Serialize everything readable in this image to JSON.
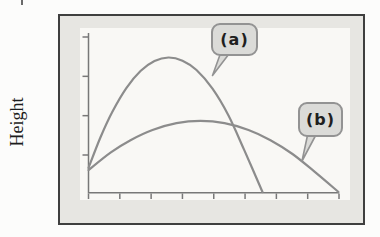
{
  "figure": {
    "ylabel": "Height",
    "xlabel": "",
    "title": "",
    "callouts": [
      {
        "id": "a",
        "label": "(a)",
        "points_to": "tall narrow curve"
      },
      {
        "id": "b",
        "label": "(b)",
        "points_to": "low wide curve"
      }
    ]
  },
  "chart_data": {
    "type": "line",
    "title": "",
    "xlabel": "",
    "ylabel": "Height",
    "xlim": [
      0,
      1
    ],
    "ylim": [
      0,
      1
    ],
    "grid": false,
    "axis_tick_numbers_shown": false,
    "x_tick_count": 9,
    "y_tick_count": 4,
    "legend_position": "callout bubbles attached to curves",
    "series": [
      {
        "name": "(a)",
        "shape": "tall narrow arc; starts partway up left axis, peaks at x~0.32, returns to baseline at x~0.70",
        "points": [
          [
            0,
            0.151
          ],
          [
            0.048,
            0.344
          ],
          [
            0.096,
            0.506
          ],
          [
            0.152,
            0.655
          ],
          [
            0.208,
            0.761
          ],
          [
            0.264,
            0.824
          ],
          [
            0.32,
            0.846
          ],
          [
            0.376,
            0.826
          ],
          [
            0.432,
            0.767
          ],
          [
            0.496,
            0.65
          ],
          [
            0.56,
            0.481
          ],
          [
            0.624,
            0.26
          ],
          [
            0.696,
            0
          ]
        ]
      },
      {
        "name": "(b)",
        "shape": "low wide arc; starts at same left-axis point, peaks at x~0.45 at about half the height of (a), returns to baseline at right end of axis",
        "points": [
          [
            0,
            0.138
          ],
          [
            0.088,
            0.248
          ],
          [
            0.168,
            0.326
          ],
          [
            0.256,
            0.39
          ],
          [
            0.352,
            0.433
          ],
          [
            0.448,
            0.447
          ],
          [
            0.544,
            0.433
          ],
          [
            0.64,
            0.39
          ],
          [
            0.728,
            0.326
          ],
          [
            0.816,
            0.239
          ],
          [
            0.904,
            0.128
          ],
          [
            1,
            0
          ]
        ]
      }
    ]
  },
  "style": {
    "page_bg": "#fcfcfb",
    "frame_border": "#3f3f3f",
    "panel_bg": "#e7e6e2",
    "plot_bg": "#f9f8f5",
    "curve_color": "#8c8c8c",
    "axis_color": "#787878",
    "bubble_fill": "#dbdbd8",
    "bubble_border": "#939393",
    "bubble_text": "#1f1f1f",
    "label_color": "#1c1c1c"
  }
}
